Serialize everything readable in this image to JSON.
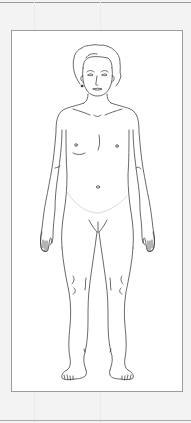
{
  "figure": {
    "type": "anatomical-body-outline",
    "view": "anterior",
    "caption": ""
  },
  "colors": {
    "background": "#f3f3f3",
    "panel": "#ffffff",
    "frame_border": "#9c9c9c",
    "line_art": "#2a2a2a",
    "faint_line": "#c8c8c8"
  }
}
